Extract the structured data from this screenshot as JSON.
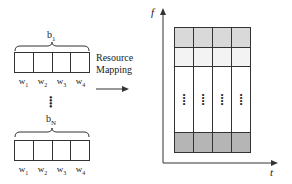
{
  "blocks": [
    {
      "label": "b",
      "sub": "1",
      "words": [
        "w1",
        "w2",
        "w3",
        "w4"
      ]
    },
    {
      "label": "b",
      "sub": "N",
      "words": [
        "w1",
        "w2",
        "w3",
        "w4"
      ]
    }
  ],
  "ellipsis": "⋮",
  "mapping": {
    "line1": "Resource",
    "line2": "Mapping"
  },
  "axes": {
    "y": "f",
    "x": "t"
  },
  "grid": {
    "columns": 4,
    "rows": [
      {
        "type": "light-gray",
        "color": "#d9d9d9"
      },
      {
        "type": "very-light",
        "color": "#f3f3f3"
      },
      {
        "type": "ellipsis",
        "color": "#ffffff",
        "marker": "⋮"
      },
      {
        "type": "dark-gray",
        "color": "#b5b5b5"
      }
    ]
  }
}
